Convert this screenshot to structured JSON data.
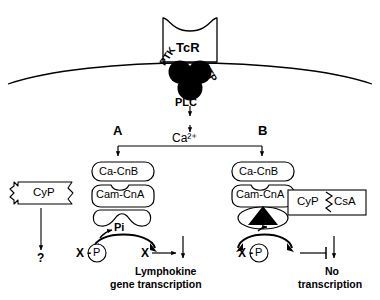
{
  "diagram": {
    "title_elements": {
      "receptor_label": "TcR",
      "kinase_label": "PTK",
      "phosphatase_label": "PTP",
      "plc_label": "PLC",
      "calcium_label": "Ca2+",
      "calcium_html": "Ca²⁺"
    },
    "branches": {
      "left_label": "A",
      "right_label": "B"
    },
    "left_pathway": {
      "cnb_label": "Ca-CnB",
      "cna_label": "Cam-CnA",
      "phosphate_label": "Pi",
      "substrate_phospho_x": "X -",
      "substrate_phospho_p": "P",
      "substrate_free": "X",
      "outcome_line1": "Lymphokine",
      "outcome_line2": "gene transcription"
    },
    "right_pathway": {
      "cnb_label": "Ca-CnB",
      "cna_label": "Cam-CnA",
      "inhibitor_cyp": "CyP",
      "inhibitor_csa": "CsA",
      "substrate_phospho_x": "X -",
      "substrate_phospho_p": "P",
      "outcome_line1": "No",
      "outcome_line2": "transcription"
    },
    "free_cyclophilin": {
      "label": "CyP",
      "unknown_target": "?"
    },
    "icons": {
      "membrane": "membrane-arc",
      "signal_blob": "trilobed-blob",
      "wedge": "black-triangle-wedge",
      "zigzag": "zigzag-bond"
    },
    "colors": {
      "stroke": "#000000",
      "background": "#ffffff",
      "fill_blob": "#000000"
    }
  }
}
